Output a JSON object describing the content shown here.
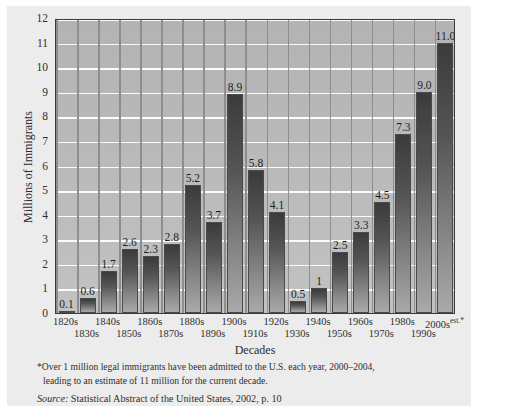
{
  "chart_data": {
    "type": "bar",
    "title": "",
    "xlabel": "Decades",
    "ylabel": "Millions of Immigrants",
    "ylim": [
      0,
      12
    ],
    "ytick_step": 1,
    "yticks": [
      "12",
      "11",
      "10",
      "9",
      "8",
      "7",
      "6",
      "5",
      "4",
      "3",
      "2",
      "1",
      "0"
    ],
    "grid": true,
    "legend": "none",
    "categories": [
      "1820s",
      "1830s",
      "1840s",
      "1850s",
      "1860s",
      "1870s",
      "1880s",
      "1890s",
      "1900s",
      "1910s",
      "1920s",
      "1930s",
      "1940s",
      "1950s",
      "1960s",
      "1970s",
      "1980s",
      "1990s",
      "2000s"
    ],
    "category_suffixes": [
      "",
      "",
      "",
      "",
      "",
      "",
      "",
      "",
      "",
      "",
      "",
      "",
      "",
      "",
      "",
      "",
      "",
      "",
      "est.*"
    ],
    "values": [
      0.1,
      0.6,
      1.7,
      2.6,
      2.3,
      2.8,
      5.2,
      3.7,
      8.9,
      5.8,
      4.1,
      0.5,
      1,
      2.5,
      3.3,
      4.5,
      7.3,
      9.0,
      11.0
    ],
    "value_labels": [
      "0.1",
      "0.6",
      "1.7",
      "2.6",
      "2.3",
      "2.8",
      "5.2",
      "3.7",
      "8.9",
      "5.8",
      "4.1",
      "0.5",
      "1",
      "2.5",
      "3.3",
      "4.5",
      "7.3",
      "9.0",
      "11.0"
    ],
    "colors": {
      "bar_top": "#3b3b3b",
      "bar_bottom": "#a9a9a9",
      "plot_background": "#b9b9b9",
      "gridline": "#fbfbfb",
      "frame": "#3a3a3a",
      "card_background": "#ececec"
    }
  },
  "footnote": {
    "line1": "*Over 1 million legal immigrants have been admitted to the U.S. each year, 2000–2004,",
    "line2": "leading to an estimate of 11 million for the current decade."
  },
  "source": {
    "lead": "Source:",
    "text": " Statistical Abstract of the United States, 2002, p. 10"
  }
}
